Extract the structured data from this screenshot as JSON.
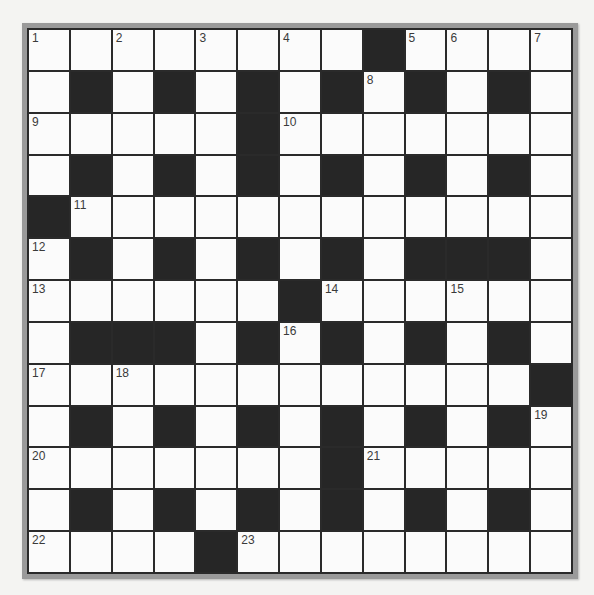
{
  "puzzle": {
    "rows": 13,
    "cols": 13,
    "colors": {
      "black_square": "#262626",
      "white_square": "#fbfbfb",
      "grid_line": "#2a2a2a",
      "frame": "#9a9a9a",
      "background": "#f4f4f2"
    },
    "layout": [
      "W.W.W.W.W.W.W.W.B.W.W.W.W",
      "W.B.W.B.W.B.W.B.W.B.W.B.W",
      "W.W.W.W.W.B.W.W.W.W.W.W.W",
      "W.B.W.B.W.B.W.B.W.B.W.B.W",
      "B.W.W.W.W.W.W.W.W.W.W.W.W",
      "W.B.W.B.W.B.W.B.W.B.B.B.W",
      "W.W.W.W.W.W.B.W.W.W.W.W.W",
      "W.B.B.B.W.B.W.B.W.B.W.B.W",
      "W.W.W.W.W.W.W.W.W.W.W.W.B",
      "W.B.W.B.W.B.W.B.W.B.W.B.W",
      "W.W.W.W.W.W.W.B.W.W.W.W.W",
      "W.B.W.B.W.B.W.B.W.B.W.B.W",
      "W.W.W.W.B.W.W.W.W.W.W.W.W"
    ],
    "numbers": [
      {
        "n": "1",
        "r": 0,
        "c": 0
      },
      {
        "n": "2",
        "r": 0,
        "c": 2
      },
      {
        "n": "3",
        "r": 0,
        "c": 4
      },
      {
        "n": "4",
        "r": 0,
        "c": 6
      },
      {
        "n": "5",
        "r": 0,
        "c": 9
      },
      {
        "n": "6",
        "r": 0,
        "c": 10
      },
      {
        "n": "7",
        "r": 0,
        "c": 12
      },
      {
        "n": "8",
        "r": 1,
        "c": 8
      },
      {
        "n": "9",
        "r": 2,
        "c": 0
      },
      {
        "n": "10",
        "r": 2,
        "c": 6
      },
      {
        "n": "11",
        "r": 4,
        "c": 1
      },
      {
        "n": "12",
        "r": 5,
        "c": 0
      },
      {
        "n": "13",
        "r": 6,
        "c": 0
      },
      {
        "n": "14",
        "r": 6,
        "c": 7
      },
      {
        "n": "15",
        "r": 6,
        "c": 10
      },
      {
        "n": "16",
        "r": 7,
        "c": 6
      },
      {
        "n": "17",
        "r": 8,
        "c": 0
      },
      {
        "n": "18",
        "r": 8,
        "c": 2
      },
      {
        "n": "19",
        "r": 9,
        "c": 12
      },
      {
        "n": "20",
        "r": 10,
        "c": 0
      },
      {
        "n": "21",
        "r": 10,
        "c": 8
      },
      {
        "n": "22",
        "r": 12,
        "c": 0
      },
      {
        "n": "23",
        "r": 12,
        "c": 5
      }
    ],
    "entries": {}
  }
}
